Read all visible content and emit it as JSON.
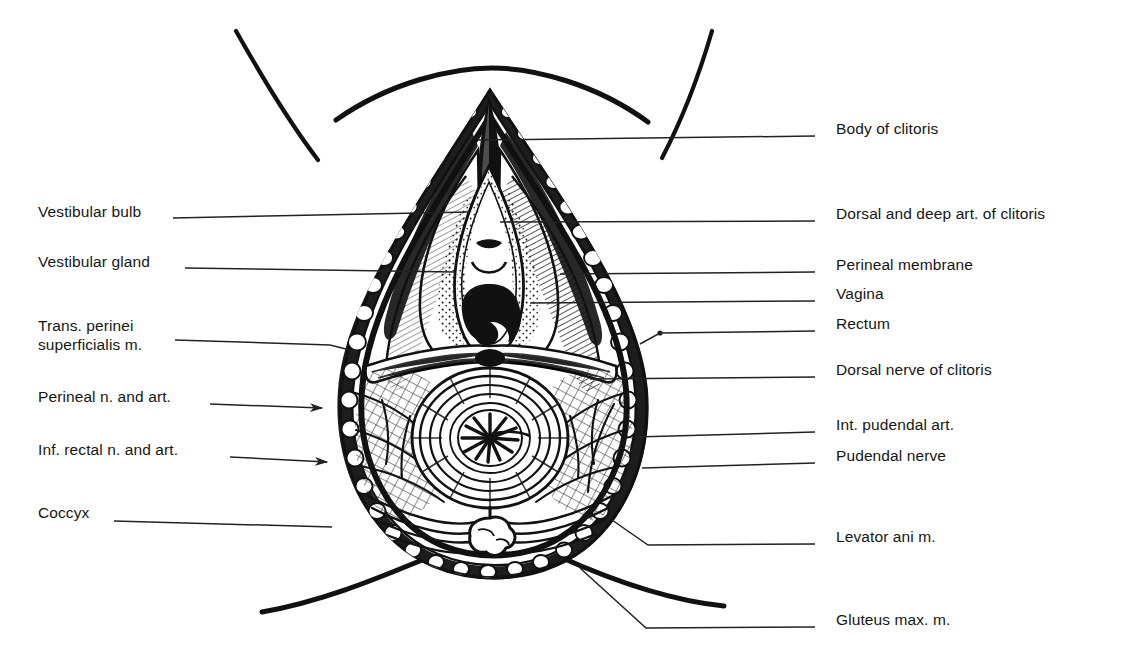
{
  "figure": {
    "background_color": "#ffffff",
    "ink_color": "#111111",
    "leader_color": "#222222"
  },
  "labels_left": [
    {
      "id": "vestibular-bulb",
      "text": "Vestibular bulb",
      "x": 38,
      "y": 212,
      "line": {
        "x1": 173,
        "y1": 218,
        "x2": 470,
        "y2": 212
      },
      "terminus": "plain"
    },
    {
      "id": "vestibular-gland",
      "text": "Vestibular gland",
      "x": 38,
      "y": 262,
      "line": {
        "x1": 185,
        "y1": 268,
        "x2": 455,
        "y2": 272
      },
      "terminus": "plain"
    },
    {
      "id": "trans-perinei",
      "text": "Trans. perinei",
      "x": 38,
      "y": 326,
      "line": {
        "x1": 175,
        "y1": 340,
        "x2": 330,
        "y2": 345
      },
      "terminus": "plain"
    },
    {
      "id": "trans-perinei-2",
      "text": "superficialis m.",
      "x": 38,
      "y": 345,
      "line": null,
      "terminus": "none"
    },
    {
      "id": "perineal-n-art",
      "text": "Perineal n. and art.",
      "x": 38,
      "y": 397,
      "line": {
        "x1": 210,
        "y1": 404,
        "x2": 320,
        "y2": 408
      },
      "terminus": "arrow"
    },
    {
      "id": "inf-rectal-n-art",
      "text": "Inf. rectal n. and art.",
      "x": 38,
      "y": 450,
      "line": {
        "x1": 230,
        "y1": 457,
        "x2": 325,
        "y2": 462
      },
      "terminus": "arrow"
    },
    {
      "id": "coccyx",
      "text": "Coccyx",
      "x": 38,
      "y": 513,
      "line": {
        "x1": 114,
        "y1": 521,
        "x2": 330,
        "y2": 527
      },
      "terminus": "plain"
    }
  ],
  "labels_right": [
    {
      "id": "body-of-clitoris",
      "text": "Body of clitoris",
      "x": 836,
      "y": 129,
      "line": {
        "x1": 815,
        "y1": 136,
        "x2": 478,
        "y2": 140
      },
      "terminus": "plain"
    },
    {
      "id": "dorsal-deep-art-clitoris",
      "text": "Dorsal and deep art. of clitoris",
      "x": 836,
      "y": 214,
      "line": {
        "x1": 815,
        "y1": 221,
        "x2": 500,
        "y2": 222
      },
      "terminus": "plain"
    },
    {
      "id": "perineal-membrane",
      "text": "Perineal membrane",
      "x": 836,
      "y": 265,
      "line": {
        "x1": 815,
        "y1": 272,
        "x2": 560,
        "y2": 274
      },
      "terminus": "plain"
    },
    {
      "id": "vagina",
      "text": "Vagina",
      "x": 836,
      "y": 294,
      "line": {
        "x1": 815,
        "y1": 301,
        "x2": 530,
        "y2": 303
      },
      "terminus": "plain"
    },
    {
      "id": "rectum",
      "text": "Rectum",
      "x": 836,
      "y": 324,
      "line": {
        "x1": 815,
        "y1": 331,
        "x2": 660,
        "y2": 333
      },
      "terminus": "dot"
    },
    {
      "id": "dorsal-nerve-clitoris",
      "text": "Dorsal nerve of clitoris",
      "x": 836,
      "y": 370,
      "line": {
        "x1": 815,
        "y1": 377,
        "x2": 590,
        "y2": 379
      },
      "terminus": "plain"
    },
    {
      "id": "int-pudendal-art",
      "text": "Int. pudendal art.",
      "x": 836,
      "y": 425,
      "line": {
        "x1": 815,
        "y1": 432,
        "x2": 635,
        "y2": 437
      },
      "terminus": "plain"
    },
    {
      "id": "pudendal-nerve",
      "text": "Pudendal nerve",
      "x": 836,
      "y": 456,
      "line": {
        "x1": 815,
        "y1": 463,
        "x2": 640,
        "y2": 468
      },
      "terminus": "plain"
    },
    {
      "id": "levator-ani",
      "text": "Levator ani m.",
      "x": 836,
      "y": 537,
      "line": {
        "x1": 815,
        "y1": 544,
        "x2": 628,
        "y2": 545
      },
      "terminus": "bent"
    },
    {
      "id": "gluteus-max",
      "text": "Gluteus max. m.",
      "x": 836,
      "y": 620,
      "line": {
        "x1": 815,
        "y1": 627,
        "x2": 640,
        "y2": 628
      },
      "terminus": "bent"
    }
  ],
  "drawing": {
    "regions": [
      {
        "id": "mons-arc",
        "name": "mons pubis arc"
      },
      {
        "id": "left-thigh-line",
        "name": "left thigh crease"
      },
      {
        "id": "right-thigh-line",
        "name": "right thigh crease"
      },
      {
        "id": "perineal-outline",
        "name": "teardrop perineal outline"
      },
      {
        "id": "fat-border",
        "name": "subcutaneous fat cobblestone border"
      },
      {
        "id": "vestibule",
        "name": "vestibule with urethral and vaginal orifices"
      },
      {
        "id": "vestibular-bulbs",
        "name": "vestibular bulbs, stippled"
      },
      {
        "id": "perineal-membrane",
        "name": "hatched perineal membrane"
      },
      {
        "id": "transverse-perinei",
        "name": "transverse perineal muscle band"
      },
      {
        "id": "anal-canal",
        "name": "anal canal with radiating mucosal folds"
      },
      {
        "id": "sphincter-rings",
        "name": "external anal sphincter rings"
      },
      {
        "id": "ischiorectal-fossa",
        "name": "ischiorectal fossa hatching"
      },
      {
        "id": "levator-fibres",
        "name": "levator ani fibres"
      },
      {
        "id": "coccyx-bone",
        "name": "coccyx"
      },
      {
        "id": "gluteal-fold",
        "name": "gluteal fold curve"
      }
    ]
  }
}
